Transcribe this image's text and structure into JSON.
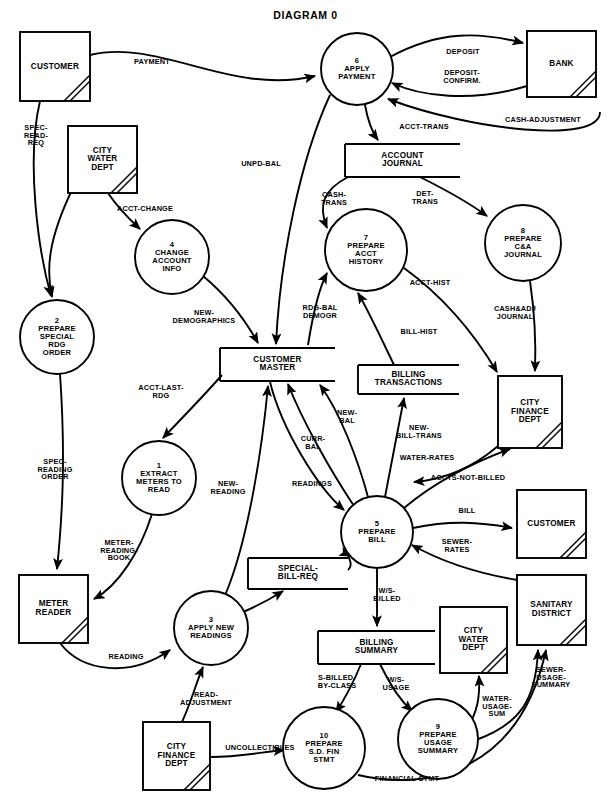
{
  "title": "DIAGRAM 0",
  "entities": [
    {
      "id": "customer-top",
      "label": "CUSTOMER",
      "x": 20,
      "y": 32,
      "w": 70,
      "h": 69
    },
    {
      "id": "bank",
      "label": "BANK",
      "x": 527,
      "y": 31,
      "w": 69,
      "h": 66
    },
    {
      "id": "city-water-dept-top",
      "label": "CITY\nWATER\nDEPT",
      "x": 68,
      "y": 126,
      "w": 69,
      "h": 67
    },
    {
      "id": "meter-reader",
      "label": "METER\nREADER",
      "x": 19,
      "y": 575,
      "w": 69,
      "h": 68
    },
    {
      "id": "city-finance-dept-right",
      "label": "CITY\nFINANCE\nDEPT",
      "x": 498,
      "y": 376,
      "w": 64,
      "h": 72
    },
    {
      "id": "customer-right",
      "label": "CUSTOMER",
      "x": 517,
      "y": 490,
      "w": 69,
      "h": 68
    },
    {
      "id": "sanitary-district",
      "label": "SANITARY\nDISTRICT",
      "x": 517,
      "y": 575,
      "w": 69,
      "h": 70
    },
    {
      "id": "city-water-dept-bottom",
      "label": "CITY\nWATER\nDEPT",
      "x": 440,
      "y": 607,
      "w": 67,
      "h": 66
    },
    {
      "id": "city-finance-dept-bottom",
      "label": "CITY\nFINANCE\nDEPT",
      "x": 143,
      "y": 722,
      "w": 67,
      "h": 68
    }
  ],
  "processes": [
    {
      "id": "p1",
      "number": "1",
      "label": "EXTRACT\nMETERS TO\nREAD",
      "cx": 159,
      "cy": 478,
      "r": 37
    },
    {
      "id": "p2",
      "number": "2",
      "label": "PREPARE\nSPECIAL\nRDG\nORDER",
      "cx": 57,
      "cy": 337,
      "r": 37
    },
    {
      "id": "p3",
      "number": "3",
      "label": "APPLY NEW\nREADINGS",
      "cx": 211,
      "cy": 628,
      "r": 37
    },
    {
      "id": "p4",
      "number": "4",
      "label": "CHANGE\nACCOUNT\nINFO",
      "cx": 172,
      "cy": 257,
      "r": 37
    },
    {
      "id": "p5",
      "number": "5",
      "label": "PREPARE\nBILL",
      "cx": 377,
      "cy": 532,
      "r": 36
    },
    {
      "id": "p6",
      "number": "6",
      "label": "APPLY\nPAYMENT",
      "cx": 357,
      "cy": 69,
      "r": 36
    },
    {
      "id": "p7",
      "number": "7",
      "label": "PREPARE\nACCT\nHISTORY",
      "cx": 366,
      "cy": 250,
      "r": 41
    },
    {
      "id": "p8",
      "number": "8",
      "label": "PREPARE\nC&A\nJOURNAL",
      "cx": 523,
      "cy": 243,
      "r": 38
    },
    {
      "id": "p9",
      "number": "9",
      "label": "PREPARE\nUSAGE\nSUMMARY",
      "cx": 438,
      "cy": 739,
      "r": 40
    },
    {
      "id": "p10",
      "number": "10",
      "label": "PREPARE\nS.D. FIN\nSTMT",
      "cx": 324,
      "cy": 748,
      "r": 41
    }
  ],
  "stores": [
    {
      "id": "account-journal",
      "label": "ACCOUNT\nJOURNAL",
      "x": 345,
      "y": 144,
      "w": 115,
      "h": 33
    },
    {
      "id": "customer-master",
      "label": "CUSTOMER\nMASTER",
      "x": 220,
      "y": 348,
      "w": 115,
      "h": 33
    },
    {
      "id": "billing-transactions",
      "label": "BILLING\nTRANSACTIONS",
      "x": 358,
      "y": 365,
      "w": 101,
      "h": 29
    },
    {
      "id": "special-bill-req",
      "label": "SPECIAL-\nBILL-REQ",
      "x": 248,
      "y": 558,
      "w": 100,
      "h": 31
    },
    {
      "id": "billing-summary",
      "label": "BILLING\nSUMMARY",
      "x": 318,
      "y": 631,
      "w": 117,
      "h": 33
    }
  ],
  "flows": [
    {
      "id": "payment",
      "label": "PAYMENT",
      "x": 152,
      "y": 62
    },
    {
      "id": "deposit",
      "label": "DEPOSIT",
      "x": 463,
      "y": 52
    },
    {
      "id": "deposit-confirm",
      "label": "DEPOSIT-\nCONFIRM.",
      "x": 462,
      "y": 77
    },
    {
      "id": "cash-adjustment",
      "label": "CASH-ADJUSTMENT",
      "x": 543,
      "y": 120
    },
    {
      "id": "acct-trans",
      "label": "ACCT-TRANS",
      "x": 424,
      "y": 127
    },
    {
      "id": "unpd-bal",
      "label": "UNPD-BAL",
      "x": 261,
      "y": 164
    },
    {
      "id": "cash-trans",
      "label": "CASH-\nTRANS",
      "x": 334,
      "y": 199
    },
    {
      "id": "det-trans",
      "label": "DET-\nTRANS",
      "x": 425,
      "y": 198
    },
    {
      "id": "acct-hist",
      "label": "ACCT-HIST",
      "x": 430,
      "y": 283
    },
    {
      "id": "cash-adj-journal",
      "label": "CASH&ADJ\nJOURNAL",
      "x": 515,
      "y": 313
    },
    {
      "id": "spec-read-req",
      "label": "SPEC-\nREAD-\nREQ",
      "x": 36,
      "y": 136
    },
    {
      "id": "acct-change",
      "label": "ACCT-CHANGE",
      "x": 145,
      "y": 209
    },
    {
      "id": "new-demographics",
      "label": "NEW-\nDEMOGRAPHICS",
      "x": 204,
      "y": 317
    },
    {
      "id": "rdg-bal-demogr",
      "label": "RDG-BAL\nDEMOGR",
      "x": 320,
      "y": 312
    },
    {
      "id": "bill-hist",
      "label": "BILL-HIST",
      "x": 419,
      "y": 332
    },
    {
      "id": "acct-last-rdg",
      "label": "ACCT-LAST-\nRDG",
      "x": 161,
      "y": 392
    },
    {
      "id": "spec-reading-order",
      "label": "SPEC-\nREADING\nORDER",
      "x": 55,
      "y": 470
    },
    {
      "id": "meter-reading-book",
      "label": "METER-\nREADING-\nBOOK",
      "x": 119,
      "y": 551
    },
    {
      "id": "new-reading",
      "label": "NEW-\nREADING",
      "x": 228,
      "y": 488
    },
    {
      "id": "readings",
      "label": "READINGS",
      "x": 312,
      "y": 484
    },
    {
      "id": "curr-bal",
      "label": "CURR-\nBAL",
      "x": 313,
      "y": 443
    },
    {
      "id": "new-bal",
      "label": "NEW-\nBAL",
      "x": 347,
      "y": 417
    },
    {
      "id": "new-bill-trans",
      "label": "NEW-\nBILL-TRANS",
      "x": 419,
      "y": 432
    },
    {
      "id": "water-rates",
      "label": "WATER-RATES",
      "x": 427,
      "y": 458
    },
    {
      "id": "accts-not-billed",
      "label": "ACCTS-NOT-BILLED",
      "x": 468,
      "y": 478
    },
    {
      "id": "bill",
      "label": "BILL",
      "x": 467,
      "y": 511
    },
    {
      "id": "sewer-rates",
      "label": "SEWER-\nRATES",
      "x": 457,
      "y": 546
    },
    {
      "id": "reading",
      "label": "READING",
      "x": 126,
      "y": 657
    },
    {
      "id": "read-adjustment",
      "label": "READ-\nADJUSTMENT",
      "x": 206,
      "y": 699
    },
    {
      "id": "uncollectibles",
      "label": "UNCOLLECTIBLES",
      "x": 260,
      "y": 748
    },
    {
      "id": "ws-billed",
      "label": "W/S-\nBILLED",
      "x": 387,
      "y": 595
    },
    {
      "id": "s-billed-by-class",
      "label": "S-BILLED-\nBY-CLASS",
      "x": 337,
      "y": 682
    },
    {
      "id": "ws-usage",
      "label": "W/S-\nUSAGE",
      "x": 396,
      "y": 684
    },
    {
      "id": "water-usage-sum",
      "label": "WATER-\nUSAGE-\nSUM",
      "x": 497,
      "y": 707
    },
    {
      "id": "sewer-usage-summary",
      "label": "SEWER-\nUSAGE-\nSUMMARY",
      "x": 551,
      "y": 678
    },
    {
      "id": "financial-stmt",
      "label": "FINANCIAL-STMT",
      "x": 407,
      "y": 779
    }
  ]
}
